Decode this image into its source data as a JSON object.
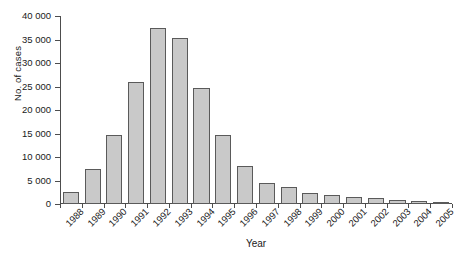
{
  "chart_data": {
    "type": "bar",
    "title": "",
    "xlabel": "Year",
    "ylabel": "No. of cases",
    "categories": [
      "1988",
      "1989",
      "1990",
      "1991",
      "1992",
      "1993",
      "1994",
      "1995",
      "1996",
      "1997",
      "1998",
      "1999",
      "2000",
      "2001",
      "2002",
      "2003",
      "2004",
      "2005"
    ],
    "values": [
      2500,
      7400,
      14600,
      25900,
      37500,
      35300,
      24600,
      14600,
      8100,
      4500,
      3600,
      2400,
      2000,
      1400,
      1200,
      900,
      600,
      300
    ],
    "ylim": [
      0,
      40000
    ],
    "ytick_values": [
      0,
      5000,
      10000,
      15000,
      20000,
      25000,
      30000,
      35000,
      40000
    ],
    "ytick_labels": [
      "0",
      "5 000",
      "10 000",
      "15 000",
      "20 000",
      "25 000",
      "30 000",
      "35 000",
      "40 000"
    ],
    "grid": false,
    "legend": null,
    "bar_fill_color": "#c9c9c9",
    "bar_border_color": "#5a5a5a",
    "axis_color": "#4d4d4d",
    "background_color": "#ffffff"
  }
}
